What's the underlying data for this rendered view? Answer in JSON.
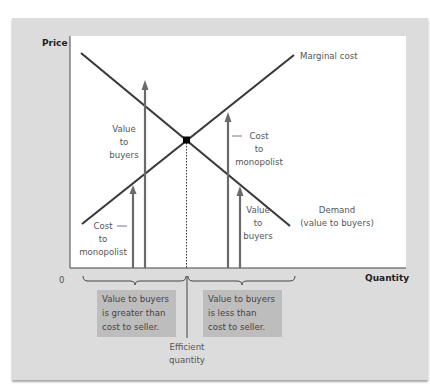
{
  "diagram": {
    "axes": {
      "y_label": "Price",
      "x_label": "Quantity",
      "origin_label": "0"
    },
    "curves": {
      "marginal_cost": {
        "label": "Marginal cost",
        "color": "#3a3a3a"
      },
      "demand": {
        "label_line1": "Demand",
        "label_line2": "(value to buyers)",
        "color": "#3a3a3a"
      }
    },
    "arrows": {
      "left_value": {
        "line1": "Value",
        "line2": "to",
        "line3": "buyers"
      },
      "left_cost": {
        "line1": "Cost",
        "line2": "to",
        "line3": "monopolist"
      },
      "right_cost": {
        "line1": "Cost",
        "line2": "to",
        "line3": "monopolist"
      },
      "right_value": {
        "line1": "Value",
        "line2": "to",
        "line3": "buyers"
      },
      "color": "#6a6a6a"
    },
    "boxes": {
      "left": {
        "line1": "Value to buyers",
        "line2": "is greater than",
        "line3": "cost to seller."
      },
      "right": {
        "line1": "Value to buyers",
        "line2": "is less than",
        "line3": "cost to seller."
      },
      "fill": "#bdbdbd"
    },
    "efficient_quantity": {
      "line1": "Efficient",
      "line2": "quantity"
    },
    "colors": {
      "panel": "#dcdcdc",
      "plot": "#ffffff",
      "equilibrium_point": "#000000"
    }
  }
}
